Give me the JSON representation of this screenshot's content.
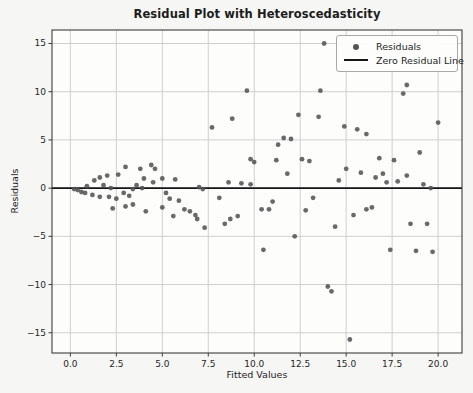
{
  "figure": {
    "title": "Residual Plot with Heteroscedasticity",
    "xlabel": "Fitted Values",
    "ylabel": "Residuals"
  },
  "legend": {
    "position": "upper right",
    "items": [
      {
        "label": "Residuals",
        "marker": "dot-icon"
      },
      {
        "label": "Zero Residual Line",
        "marker": "line-icon"
      }
    ]
  },
  "colors": {
    "point": "#545454",
    "zero_line": "#161616",
    "grid": "#cbcbcb",
    "spine": "#3c3c3c",
    "tick_text": "#262626",
    "page_bg": "#f6f6f4",
    "plot_bg": "#fdfdfc"
  },
  "chart_data": {
    "type": "scatter",
    "title": "Residual Plot with Heteroscedasticity",
    "xlabel": "Fitted Values",
    "ylabel": "Residuals",
    "grid": true,
    "legend_position": "upper right",
    "xlim": [
      -1,
      21.3
    ],
    "ylim": [
      -17.1,
      16.4
    ],
    "x_tick_values": [
      0,
      2.5,
      5,
      7.5,
      10,
      12.5,
      15,
      17.5,
      20
    ],
    "x_tick_labels": [
      "0.0",
      "2.5",
      "5.0",
      "7.5",
      "10.0",
      "12.5",
      "15.0",
      "17.5",
      "20.0"
    ],
    "y_tick_values": [
      -15,
      -10,
      -5,
      0,
      5,
      10,
      15
    ],
    "y_tick_labels": [
      "−15",
      "−10",
      "−5",
      "0",
      "5",
      "10",
      "15"
    ],
    "series": [
      {
        "name": "Residuals",
        "type": "scatter",
        "color": "#545454",
        "points": [
          [
            0.2,
            -0.1
          ],
          [
            0.4,
            -0.2
          ],
          [
            0.6,
            -0.4
          ],
          [
            0.8,
            -0.5
          ],
          [
            0.9,
            0.2
          ],
          [
            1.2,
            -0.7
          ],
          [
            1.3,
            0.8
          ],
          [
            1.6,
            -0.9
          ],
          [
            1.6,
            1.1
          ],
          [
            1.8,
            0.3
          ],
          [
            2.0,
            1.3
          ],
          [
            2.1,
            -0.9
          ],
          [
            2.2,
            0.0
          ],
          [
            2.3,
            -2.1
          ],
          [
            2.5,
            -1.1
          ],
          [
            2.6,
            1.4
          ],
          [
            2.9,
            -0.5
          ],
          [
            3.0,
            2.2
          ],
          [
            3.0,
            -1.9
          ],
          [
            3.2,
            -0.8
          ],
          [
            3.4,
            -1.7
          ],
          [
            3.4,
            -0.1
          ],
          [
            3.6,
            0.3
          ],
          [
            3.8,
            2.0
          ],
          [
            3.9,
            0.0
          ],
          [
            4.0,
            1.0
          ],
          [
            4.1,
            -2.4
          ],
          [
            4.4,
            2.4
          ],
          [
            4.5,
            0.6
          ],
          [
            4.6,
            2.0
          ],
          [
            5.0,
            1.0
          ],
          [
            5.0,
            -2.0
          ],
          [
            5.2,
            -0.5
          ],
          [
            5.4,
            -1.1
          ],
          [
            5.6,
            -2.9
          ],
          [
            5.7,
            0.9
          ],
          [
            5.9,
            -1.3
          ],
          [
            6.2,
            -2.2
          ],
          [
            6.5,
            -2.4
          ],
          [
            6.8,
            -2.8
          ],
          [
            6.9,
            -3.2
          ],
          [
            7.0,
            0.1
          ],
          [
            7.2,
            -0.1
          ],
          [
            7.3,
            -4.1
          ],
          [
            7.7,
            6.3
          ],
          [
            8.1,
            -1.0
          ],
          [
            8.4,
            -3.7
          ],
          [
            8.6,
            0.6
          ],
          [
            8.7,
            -3.2
          ],
          [
            8.8,
            7.2
          ],
          [
            9.1,
            -2.9
          ],
          [
            9.3,
            0.5
          ],
          [
            9.6,
            10.1
          ],
          [
            9.8,
            3.0
          ],
          [
            9.8,
            0.4
          ],
          [
            10.0,
            2.7
          ],
          [
            10.4,
            -2.2
          ],
          [
            10.5,
            -6.4
          ],
          [
            10.8,
            -2.2
          ],
          [
            11.0,
            -1.4
          ],
          [
            11.2,
            2.9
          ],
          [
            11.3,
            4.5
          ],
          [
            11.6,
            5.2
          ],
          [
            11.8,
            1.5
          ],
          [
            12.0,
            5.1
          ],
          [
            12.2,
            -5.0
          ],
          [
            12.4,
            7.6
          ],
          [
            12.6,
            3.0
          ],
          [
            12.8,
            -2.3
          ],
          [
            13.0,
            2.8
          ],
          [
            13.2,
            -1.0
          ],
          [
            13.5,
            7.4
          ],
          [
            13.6,
            10.1
          ],
          [
            13.8,
            15.0
          ],
          [
            14.0,
            -10.2
          ],
          [
            14.2,
            -10.7
          ],
          [
            14.4,
            -4.0
          ],
          [
            14.6,
            0.8
          ],
          [
            14.9,
            6.4
          ],
          [
            15.0,
            2.0
          ],
          [
            15.2,
            -15.7
          ],
          [
            15.4,
            -2.8
          ],
          [
            15.6,
            6.1
          ],
          [
            15.8,
            1.6
          ],
          [
            16.1,
            5.6
          ],
          [
            16.1,
            -2.2
          ],
          [
            16.4,
            -2.0
          ],
          [
            16.6,
            1.1
          ],
          [
            16.8,
            3.1
          ],
          [
            17.0,
            1.5
          ],
          [
            17.2,
            0.6
          ],
          [
            17.4,
            -6.4
          ],
          [
            17.6,
            2.9
          ],
          [
            17.8,
            0.7
          ],
          [
            18.1,
            9.8
          ],
          [
            18.3,
            10.7
          ],
          [
            18.3,
            1.3
          ],
          [
            18.5,
            -3.7
          ],
          [
            18.8,
            -6.5
          ],
          [
            19.0,
            3.7
          ],
          [
            19.2,
            0.4
          ],
          [
            19.4,
            -3.7
          ],
          [
            19.6,
            0.0
          ],
          [
            19.7,
            -6.6
          ],
          [
            20.0,
            6.8
          ]
        ]
      },
      {
        "name": "Zero Residual Line",
        "type": "hline",
        "y": 0,
        "color": "#161616"
      }
    ]
  }
}
